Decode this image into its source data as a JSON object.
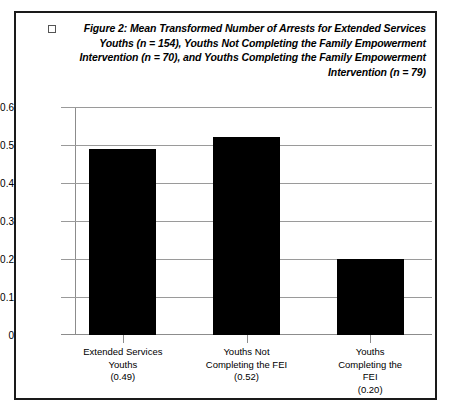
{
  "figure": {
    "bullet_icon": "empty-square-bullet",
    "caption": "Figure 2: Mean Transformed Number of Arrests for Extended Services Youths (n = 154), Youths Not Completing the Family Empowerment Intervention  (n = 70), and Youths  Completing the Family Empowerment Intervention (n = 79)"
  },
  "chart_data": {
    "type": "bar",
    "categories": [
      "Extended Services\nYouths\n(0.49)",
      "Youths Not\nCompleting the FEI\n(0.52)",
      "Youths\nCompleting the\nFEI\n(0.20)"
    ],
    "category_names": [
      "Extended Services Youths",
      "Youths Not Completing the FEI",
      "Youths Completing the FEI"
    ],
    "values": [
      0.49,
      0.52,
      0.2
    ],
    "value_labels": [
      "(0.49)",
      "(0.52)",
      "(0.20)"
    ],
    "sample_sizes": [
      154,
      70,
      79
    ],
    "xlabel": "",
    "ylabel": "",
    "ylim": [
      0,
      0.6
    ],
    "ytick_labels": [
      "0.6",
      "0.5",
      "0.4",
      "0.3",
      "0.2",
      "0.1",
      "0"
    ],
    "ytick_values": [
      0.6,
      0.5,
      0.4,
      0.3,
      0.2,
      0.1,
      0
    ],
    "grid": true,
    "legend": false,
    "bar_color": "#000000",
    "grid_color": "#9a9a9a",
    "axis_color": "#8c8c8c",
    "frame_color": "#1a1a1a"
  }
}
